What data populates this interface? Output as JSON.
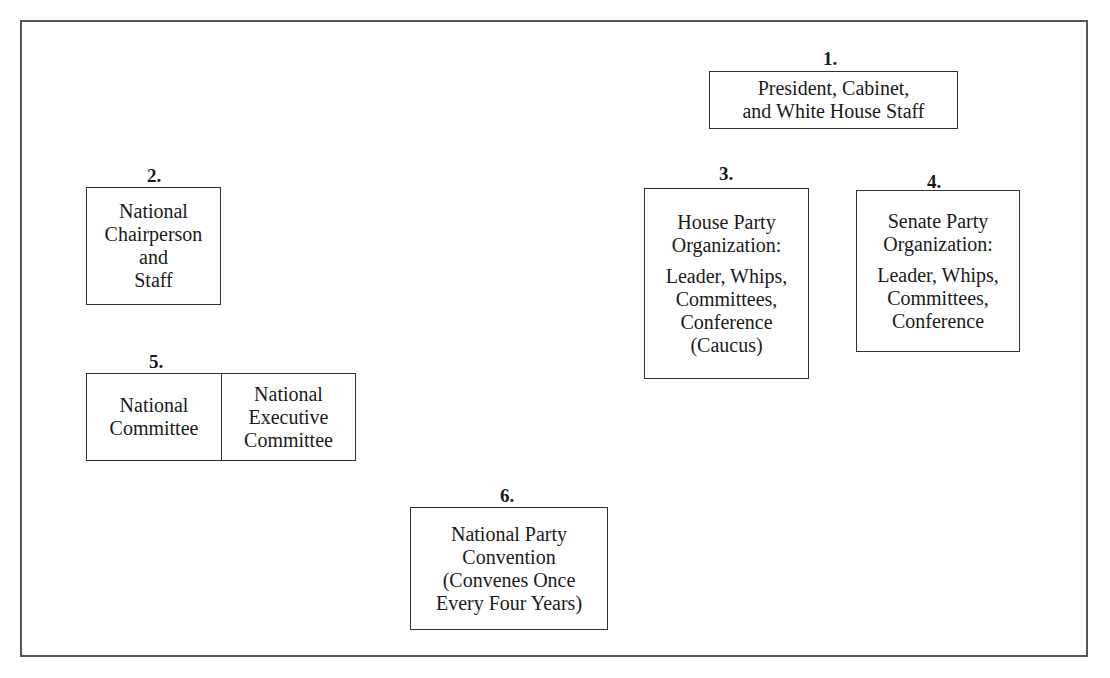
{
  "diagram": {
    "type": "organization-boxes",
    "nodes": [
      {
        "number": "1.",
        "lines": [
          "President, Cabinet,",
          "and White House Staff"
        ]
      },
      {
        "number": "2.",
        "lines": [
          "National",
          "Chairperson",
          "and",
          "Staff"
        ]
      },
      {
        "number": "3.",
        "heading": [
          "House Party",
          "Organization:"
        ],
        "lines": [
          "Leader, Whips,",
          "Committees,",
          "Conference",
          "(Caucus)"
        ]
      },
      {
        "number": "4.",
        "heading": [
          "Senate Party",
          "Organization:"
        ],
        "lines": [
          "Leader, Whips,",
          "Committees,",
          "Conference"
        ]
      },
      {
        "number": "5.",
        "cells": [
          {
            "lines": [
              "National",
              "Committee"
            ]
          },
          {
            "lines": [
              "National",
              "Executive",
              "Committee"
            ]
          }
        ]
      },
      {
        "number": "6.",
        "lines": [
          "National Party",
          "Convention",
          "(Convenes Once",
          "Every Four Years)"
        ]
      }
    ]
  }
}
